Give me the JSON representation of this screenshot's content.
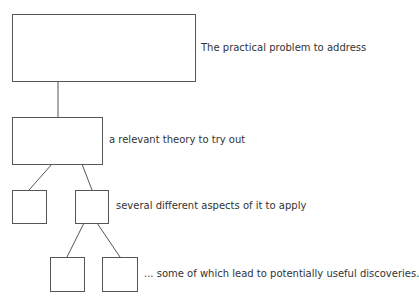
{
  "diagram": {
    "type": "tree",
    "levels": [
      {
        "label": "The practical problem to address"
      },
      {
        "label": "a relevant theory to try out"
      },
      {
        "label": "several different aspects of it to apply"
      },
      {
        "label": "... some of which lead to potentially useful discoveries."
      }
    ],
    "colors": {
      "stroke": "#555555",
      "text": "#333333",
      "background": "#ffffff"
    }
  }
}
